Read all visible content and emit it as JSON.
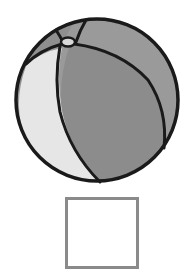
{
  "figure": {
    "colors": {
      "outline": "#1a1a1a",
      "dark_panel": "#8c8c8c",
      "mid_panel": "#9a9a9a",
      "light_panel": "#e6e6e6",
      "top_cap": "#d9d9d9"
    }
  },
  "answer_box": {
    "value": "",
    "border_color": "#8a8a8a"
  }
}
